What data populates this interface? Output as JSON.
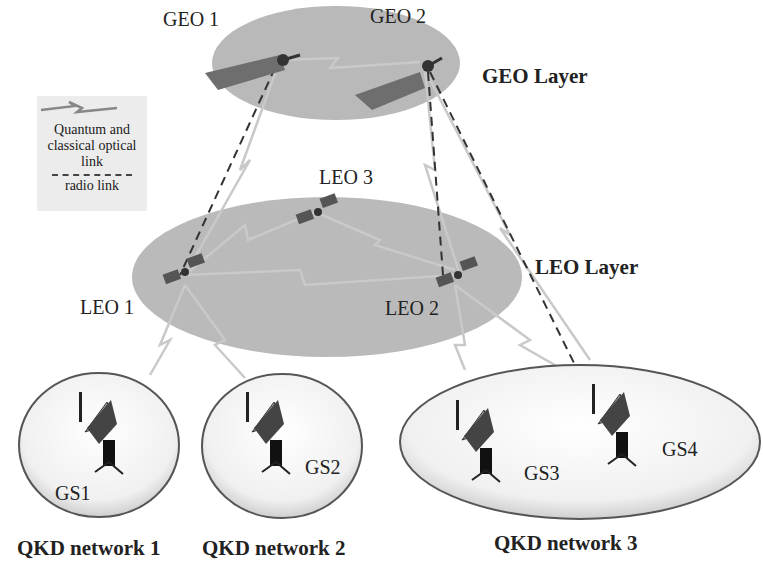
{
  "legend": {
    "optical_link_label": "Quantum and classical optical link",
    "radio_link_label": "radio link",
    "icons": [
      "lightning-link-icon",
      "dashed-line-icon"
    ]
  },
  "layers": {
    "geo": {
      "label": "GEO Layer",
      "satellites": [
        "GEO 1",
        "GEO 2"
      ]
    },
    "leo": {
      "label": "LEO Layer",
      "satellites": [
        "LEO 1",
        "LEO 2",
        "LEO 3"
      ]
    }
  },
  "networks": [
    {
      "label": "QKD network 1",
      "stations": [
        "GS1"
      ]
    },
    {
      "label": "QKD network 2",
      "stations": [
        "GS2"
      ]
    },
    {
      "label": "QKD network 3",
      "stations": [
        "GS3",
        "GS4"
      ]
    }
  ],
  "colors": {
    "layer_fill": "#b8b8b8",
    "network_fill": "#f2f2f2",
    "optical_link": "#c8c8c8",
    "radio_link": "#333333",
    "legend_bg": "#ececec"
  }
}
